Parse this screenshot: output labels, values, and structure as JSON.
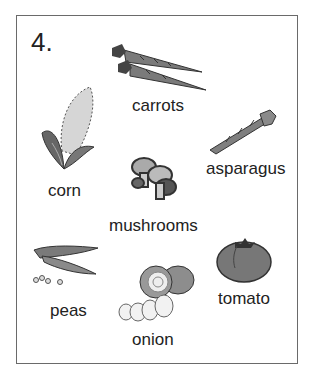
{
  "exercise": {
    "number": "4.",
    "items": [
      {
        "name": "carrots",
        "label": "carrots"
      },
      {
        "name": "asparagus",
        "label": "asparagus"
      },
      {
        "name": "corn",
        "label": "corn"
      },
      {
        "name": "mushrooms",
        "label": "mushrooms"
      },
      {
        "name": "peas",
        "label": "peas"
      },
      {
        "name": "onion",
        "label": "onion"
      },
      {
        "name": "tomato",
        "label": "tomato"
      }
    ]
  },
  "colors": {
    "border": "#6a6a6a",
    "text": "#222222",
    "illustration_dark": "#555555",
    "illustration_mid": "#8a8a8a",
    "illustration_light": "#cfcfcf"
  }
}
